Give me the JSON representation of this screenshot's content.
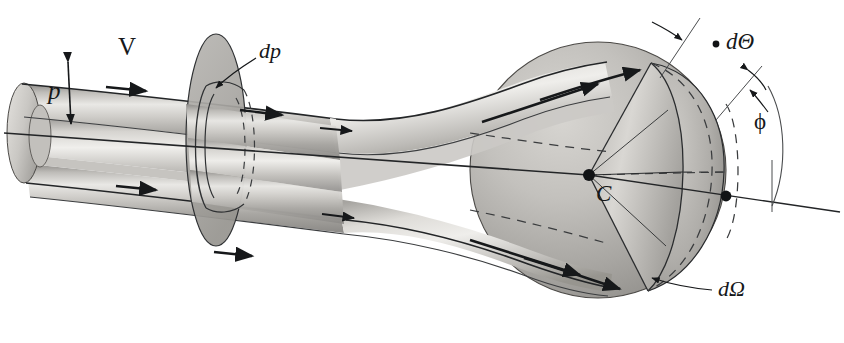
{
  "figure": {
    "kind": "scattering-geometry-diagram",
    "background_color": "#ffffff",
    "ink_color": "#16181a",
    "shade_light": "#f2f1ef",
    "shade_mid": "#b9b7b3",
    "shade_dark": "#7c7a77",
    "width": 844,
    "height": 343
  },
  "labels": {
    "velocity": "V",
    "impact_parameter": "p",
    "impact_parameter_element": "dp",
    "scattering_angle_element": "dΘ",
    "azimuthal_angle": "ϕ",
    "solid_angle_element": "dΩ",
    "scattering_center": "C"
  },
  "label_positions": {
    "velocity": {
      "x": 118,
      "y": 34
    },
    "impact_parameter": {
      "x": 48,
      "y": 78
    },
    "impact_parameter_element": {
      "x": 259,
      "y": 48
    },
    "scattering_angle_element": {
      "x": 722,
      "y": 37
    },
    "azimuthal_angle": {
      "x": 754,
      "y": 120
    },
    "solid_angle_element": {
      "x": 716,
      "y": 285
    },
    "scattering_center": {
      "x": 596,
      "y": 186
    }
  },
  "annotations": {
    "beam_direction_arrows": 6,
    "cone_surface_arrows": 4,
    "dp_leader_line": true,
    "dOmega_leader_line": true,
    "dTheta_tick_arrow": true,
    "phi_arc_arrow": true,
    "p_double_arrow": true
  },
  "geometry": {
    "beam_axis_left": {
      "x": 4,
      "y": 133
    },
    "beam_axis_right": {
      "x": 840,
      "y": 212
    },
    "scattering_center_point": {
      "x": 589,
      "y": 175
    },
    "sphere_center": {
      "x": 598,
      "y": 170
    },
    "sphere_radius": 128,
    "annulus_center": {
      "x": 216,
      "y": 140
    },
    "cylinder_left_end": {
      "x": 22,
      "y": 120
    }
  }
}
